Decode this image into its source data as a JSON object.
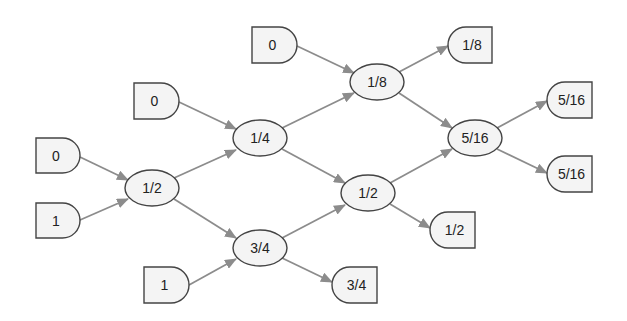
{
  "diagram": {
    "type": "dataflow-graph",
    "colors": {
      "node_fill": "#f4f4f4",
      "node_stroke": "#444444",
      "edge": "#8c8c8c",
      "text": "#222222"
    },
    "inputs": [
      {
        "id": "in_a",
        "label": "0",
        "x": 36,
        "y": 138,
        "w": 44,
        "h": 35
      },
      {
        "id": "in_b",
        "label": "1",
        "x": 36,
        "y": 203,
        "w": 44,
        "h": 35
      },
      {
        "id": "in_c",
        "label": "0",
        "x": 134,
        "y": 83,
        "w": 45,
        "h": 36
      },
      {
        "id": "in_d",
        "label": "1",
        "x": 144,
        "y": 267,
        "w": 45,
        "h": 36
      },
      {
        "id": "in_e",
        "label": "0",
        "x": 252,
        "y": 27,
        "w": 45,
        "h": 36
      }
    ],
    "operations": [
      {
        "id": "op_half_1",
        "label": "1/2",
        "cx": 152,
        "cy": 188,
        "rx": 27,
        "ry": 18
      },
      {
        "id": "op_quarter",
        "label": "1/4",
        "cx": 260,
        "cy": 138,
        "rx": 27,
        "ry": 18
      },
      {
        "id": "op_three_quarters",
        "label": "3/4",
        "cx": 260,
        "cy": 248,
        "rx": 27,
        "ry": 18
      },
      {
        "id": "op_eighth",
        "label": "1/8",
        "cx": 377,
        "cy": 82,
        "rx": 27,
        "ry": 18
      },
      {
        "id": "op_half_2",
        "label": "1/2",
        "cx": 368,
        "cy": 193,
        "rx": 27,
        "ry": 18
      },
      {
        "id": "op_five_sixteenths",
        "label": "5/16",
        "cx": 475,
        "cy": 138,
        "rx": 27,
        "ry": 18
      }
    ],
    "outputs": [
      {
        "id": "out_eighth",
        "label": "1/8",
        "x": 448,
        "y": 27,
        "w": 44,
        "h": 36
      },
      {
        "id": "out_five_sixteenths_a",
        "label": "5/16",
        "x": 547,
        "y": 82,
        "w": 45,
        "h": 36
      },
      {
        "id": "out_five_sixteenths_b",
        "label": "5/16",
        "x": 547,
        "y": 156,
        "w": 45,
        "h": 36
      },
      {
        "id": "out_half",
        "label": "1/2",
        "x": 430,
        "y": 212,
        "w": 45,
        "h": 36
      },
      {
        "id": "out_three_quarters",
        "label": "3/4",
        "x": 332,
        "y": 267,
        "w": 45,
        "h": 36
      }
    ],
    "edges": [
      {
        "from": "in_a",
        "to": "op_half_1",
        "x1": 80,
        "y1": 157,
        "x2": 128,
        "y2": 180
      },
      {
        "from": "in_b",
        "to": "op_half_1",
        "x1": 80,
        "y1": 220,
        "x2": 128,
        "y2": 199
      },
      {
        "from": "in_c",
        "to": "op_quarter",
        "x1": 179,
        "y1": 102,
        "x2": 236,
        "y2": 129
      },
      {
        "from": "op_half_1",
        "to": "op_quarter",
        "x1": 174,
        "y1": 178,
        "x2": 236,
        "y2": 150
      },
      {
        "from": "op_half_1",
        "to": "op_three_quarters",
        "x1": 174,
        "y1": 199,
        "x2": 236,
        "y2": 238
      },
      {
        "from": "in_d",
        "to": "op_three_quarters",
        "x1": 189,
        "y1": 285,
        "x2": 236,
        "y2": 259
      },
      {
        "from": "in_e",
        "to": "op_eighth",
        "x1": 297,
        "y1": 46,
        "x2": 354,
        "y2": 73
      },
      {
        "from": "op_quarter",
        "to": "op_eighth",
        "x1": 282,
        "y1": 128,
        "x2": 354,
        "y2": 93
      },
      {
        "from": "op_quarter",
        "to": "op_half_2",
        "x1": 282,
        "y1": 149,
        "x2": 345,
        "y2": 183
      },
      {
        "from": "op_three_quarters",
        "to": "op_half_2",
        "x1": 282,
        "y1": 238,
        "x2": 345,
        "y2": 205
      },
      {
        "from": "op_three_quarters",
        "to": "out_three_quarters",
        "x1": 282,
        "y1": 258,
        "x2": 332,
        "y2": 282
      },
      {
        "from": "op_eighth",
        "to": "out_eighth",
        "x1": 399,
        "y1": 72,
        "x2": 448,
        "y2": 46
      },
      {
        "from": "op_eighth",
        "to": "op_five_sixteenths",
        "x1": 399,
        "y1": 93,
        "x2": 452,
        "y2": 128
      },
      {
        "from": "op_half_2",
        "to": "op_five_sixteenths",
        "x1": 390,
        "y1": 183,
        "x2": 452,
        "y2": 149
      },
      {
        "from": "op_half_2",
        "to": "out_half",
        "x1": 390,
        "y1": 204,
        "x2": 430,
        "y2": 228
      },
      {
        "from": "op_five_sixteenths",
        "to": "out_five_sixteenths_a",
        "x1": 497,
        "y1": 128,
        "x2": 547,
        "y2": 101
      },
      {
        "from": "op_five_sixteenths",
        "to": "out_five_sixteenths_b",
        "x1": 497,
        "y1": 149,
        "x2": 547,
        "y2": 173
      }
    ]
  }
}
